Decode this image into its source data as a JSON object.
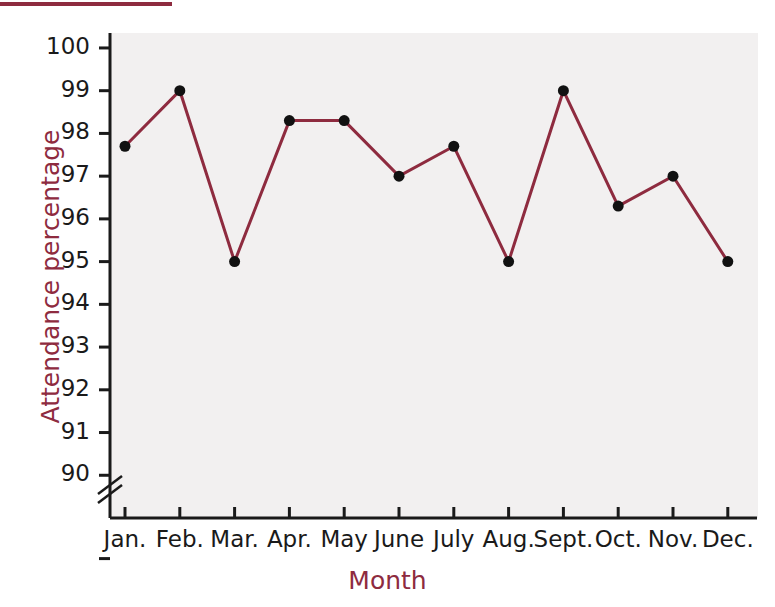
{
  "decor": {
    "top_rule_color": "#8e2b3f"
  },
  "chart_data": {
    "type": "line",
    "title": "",
    "xlabel": "Month",
    "ylabel": "Attendance percentage",
    "categories": [
      "Jan.",
      "Feb.",
      "Mar.",
      "Apr.",
      "May",
      "June",
      "July",
      "Aug.",
      "Sept.",
      "Oct.",
      "Nov.",
      "Dec."
    ],
    "values": [
      97.7,
      99.0,
      95.0,
      98.3,
      98.3,
      97.0,
      97.7,
      95.0,
      99.0,
      96.3,
      97.0,
      95.0
    ],
    "ylim": [
      90,
      100
    ],
    "yticks": [
      90,
      91,
      92,
      93,
      94,
      95,
      96,
      97,
      98,
      99,
      100
    ],
    "ytick_labels": [
      "90",
      "91",
      "92",
      "93",
      "94",
      "95",
      "96",
      "97",
      "98",
      "99",
      "100"
    ],
    "axis_break": true,
    "axis_break_note": "y-axis broken below 90",
    "grid": false,
    "legend": "none",
    "series": [
      {
        "name": "Attendance percentage",
        "values": [
          97.7,
          99.0,
          95.0,
          98.3,
          98.3,
          97.0,
          97.7,
          95.0,
          99.0,
          96.3,
          97.0,
          95.0
        ]
      }
    ],
    "line_color": "#8e2b3f",
    "marker_color": "#111111",
    "plot_background": "#f2f0f0"
  }
}
